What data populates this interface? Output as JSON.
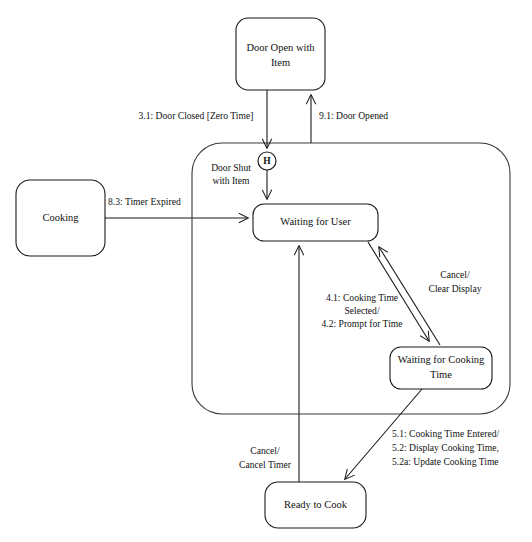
{
  "diagram": {
    "type": "uml-state-machine",
    "canvas": {
      "width": 532,
      "height": 542
    },
    "background_color": "#ffffff",
    "line_color": "#1a1a1a",
    "superstate_line_color": "#3a3a3a"
  },
  "states": {
    "door_open_with_item": {
      "label_line1": "Door Open with",
      "label_line2": "Item",
      "x": 236,
      "y": 18,
      "width": 89,
      "height": 72
    },
    "cooking": {
      "label": "Cooking",
      "x": 16,
      "y": 180,
      "width": 89,
      "height": 76
    },
    "waiting_for_user": {
      "label": "Waiting for User",
      "x": 253,
      "y": 204,
      "width": 125,
      "height": 37
    },
    "waiting_for_cooking_time": {
      "label_line1": "Waiting for Cooking",
      "label_line2": "Time",
      "x": 390,
      "y": 347,
      "width": 102,
      "height": 42
    },
    "ready_to_cook": {
      "label": "Ready to Cook",
      "x": 265,
      "y": 482,
      "width": 101,
      "height": 46
    }
  },
  "superstate": {
    "name": "door-shut-with-item",
    "label_line1": "Door Shut",
    "label_line2": "with Item",
    "x": 192,
    "y": 143,
    "width": 318,
    "height": 271,
    "label_x": 231,
    "label_y1": 169,
    "label_y2": 181
  },
  "history_pseudostate": {
    "symbol": "H",
    "cx": 267,
    "cy": 161,
    "r": 9
  },
  "transitions": [
    {
      "name": "door-closed-zero-time",
      "label": "3.1: Door Closed [Zero Time]",
      "from": "door_open_with_item",
      "to": "history_pseudostate",
      "label_x": 196,
      "label_y": 117
    },
    {
      "name": "door-opened",
      "label": "9.1: Door Opened",
      "from": "door_shut_with_item",
      "to": "door_open_with_item",
      "label_x": 319,
      "label_y": 117
    },
    {
      "name": "timer-expired",
      "label": "8.3: Timer Expired",
      "from": "cooking",
      "to": "waiting_for_user",
      "label_x": 108,
      "label_y": 203
    },
    {
      "name": "cooking-time-selected",
      "label_line1": "4.1: Cooking Time",
      "label_line2": "Selected/",
      "label_line3": "4.2: Prompt for Time",
      "from": "waiting_for_user",
      "to": "waiting_for_cooking_time",
      "label_x": 362,
      "label_y1": 299,
      "label_y2": 312,
      "label_y3": 325
    },
    {
      "name": "cancel-clear-display",
      "label_line1": "Cancel/",
      "label_line2": "Clear Display",
      "from": "waiting_for_cooking_time",
      "to": "waiting_for_user",
      "label_x": 455,
      "label_y1": 276,
      "label_y2": 290
    },
    {
      "name": "cooking-time-entered",
      "label_line1": "5.1: Cooking Time Entered/",
      "label_line2": "5.2: Display Cooking Time,",
      "label_line3": "5.2a: Update Cooking Time",
      "from": "waiting_for_cooking_time",
      "to": "ready_to_cook",
      "label_x": 392,
      "label_y1": 435,
      "label_y2": 449,
      "label_y3": 463
    },
    {
      "name": "cancel-cancel-timer",
      "label_line1": "Cancel/",
      "label_line2": "Cancel Timer",
      "from": "ready_to_cook",
      "to": "waiting_for_user",
      "label_x": 265,
      "label_y1": 452,
      "label_y2": 466
    }
  ]
}
